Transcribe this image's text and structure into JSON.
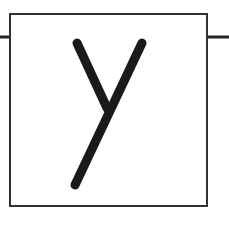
{
  "diagram": {
    "type": "block",
    "block": {
      "label": "y",
      "x": 10,
      "y": 13,
      "width": 197,
      "height": 193,
      "border_color": "#333333",
      "fill": "#ffffff"
    },
    "connections": [
      {
        "name": "input-line",
        "x1": 0,
        "y1": 37,
        "x2": 10,
        "y2": 37
      },
      {
        "name": "output-line",
        "x1": 207,
        "y1": 37,
        "x2": 229,
        "y2": 37
      }
    ],
    "glyph_color": "#1a1a1a",
    "line_color": "#222222"
  }
}
